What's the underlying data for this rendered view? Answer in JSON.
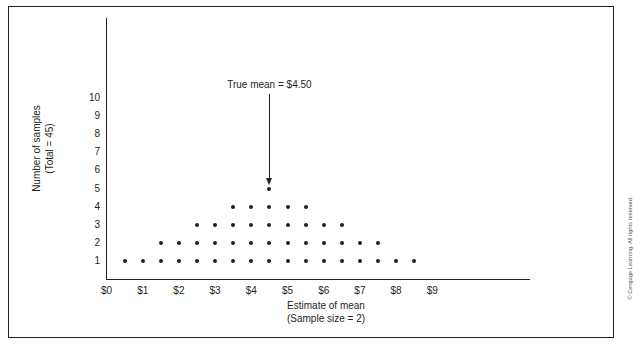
{
  "figure": {
    "copyright": "© Cengage Learning. All rights reserved."
  },
  "annotation": {
    "label": "True mean  =  $4.50",
    "icon": "down-arrow-icon"
  },
  "chart_data": {
    "type": "scatter",
    "subtype": "dotplot",
    "title": "",
    "xlabel_line1": "Estimate of mean",
    "xlabel_line2": "(Sample size = 2)",
    "ylabel_line1": "Number of samples",
    "ylabel_line2": "(Total = 45)",
    "grid": false,
    "legend": "none",
    "xlim": [
      0,
      9.6
    ],
    "ylim": [
      0,
      10.8
    ],
    "xticks": [
      0,
      1,
      2,
      3,
      4,
      5,
      6,
      7,
      8,
      9
    ],
    "xticklabels": [
      "$0",
      "$1",
      "$2",
      "$3",
      "$4",
      "$5",
      "$6",
      "$7",
      "$8",
      "$9"
    ],
    "yticks": [
      1,
      2,
      3,
      4,
      5,
      6,
      7,
      8,
      9,
      10
    ],
    "yticklabels": [
      "1",
      "2",
      "3",
      "4",
      "5",
      "6",
      "7",
      "8",
      "9",
      "10"
    ],
    "bin_width": 0.5,
    "total_samples": 45,
    "true_mean": 4.5,
    "x": [
      0.5,
      1.0,
      1.5,
      2.0,
      2.5,
      3.0,
      3.5,
      4.0,
      4.5,
      5.0,
      5.5,
      6.0,
      6.5,
      7.0,
      7.5,
      8.0,
      8.5
    ],
    "counts": [
      1,
      1,
      2,
      2,
      3,
      3,
      4,
      4,
      5,
      4,
      4,
      3,
      3,
      2,
      2,
      1,
      1
    ],
    "points": [
      {
        "x": 0.5,
        "y": 1
      },
      {
        "x": 1.0,
        "y": 1
      },
      {
        "x": 1.5,
        "y": 1
      },
      {
        "x": 1.5,
        "y": 2
      },
      {
        "x": 2.0,
        "y": 1
      },
      {
        "x": 2.0,
        "y": 2
      },
      {
        "x": 2.5,
        "y": 1
      },
      {
        "x": 2.5,
        "y": 2
      },
      {
        "x": 2.5,
        "y": 3
      },
      {
        "x": 3.0,
        "y": 1
      },
      {
        "x": 3.0,
        "y": 2
      },
      {
        "x": 3.0,
        "y": 3
      },
      {
        "x": 3.5,
        "y": 1
      },
      {
        "x": 3.5,
        "y": 2
      },
      {
        "x": 3.5,
        "y": 3
      },
      {
        "x": 3.5,
        "y": 4
      },
      {
        "x": 4.0,
        "y": 1
      },
      {
        "x": 4.0,
        "y": 2
      },
      {
        "x": 4.0,
        "y": 3
      },
      {
        "x": 4.0,
        "y": 4
      },
      {
        "x": 4.5,
        "y": 1
      },
      {
        "x": 4.5,
        "y": 2
      },
      {
        "x": 4.5,
        "y": 3
      },
      {
        "x": 4.5,
        "y": 4
      },
      {
        "x": 4.5,
        "y": 5
      },
      {
        "x": 5.0,
        "y": 1
      },
      {
        "x": 5.0,
        "y": 2
      },
      {
        "x": 5.0,
        "y": 3
      },
      {
        "x": 5.0,
        "y": 4
      },
      {
        "x": 5.5,
        "y": 1
      },
      {
        "x": 5.5,
        "y": 2
      },
      {
        "x": 5.5,
        "y": 3
      },
      {
        "x": 5.5,
        "y": 4
      },
      {
        "x": 6.0,
        "y": 1
      },
      {
        "x": 6.0,
        "y": 2
      },
      {
        "x": 6.0,
        "y": 3
      },
      {
        "x": 6.5,
        "y": 1
      },
      {
        "x": 6.5,
        "y": 2
      },
      {
        "x": 6.5,
        "y": 3
      },
      {
        "x": 7.0,
        "y": 1
      },
      {
        "x": 7.0,
        "y": 2
      },
      {
        "x": 7.5,
        "y": 1
      },
      {
        "x": 7.5,
        "y": 2
      },
      {
        "x": 8.0,
        "y": 1
      },
      {
        "x": 8.5,
        "y": 1
      }
    ],
    "colors": {
      "dot": "#231f20",
      "axis": "#231f20",
      "text": "#231f20",
      "frame": "#231f20",
      "copyright": "#58595b"
    }
  }
}
